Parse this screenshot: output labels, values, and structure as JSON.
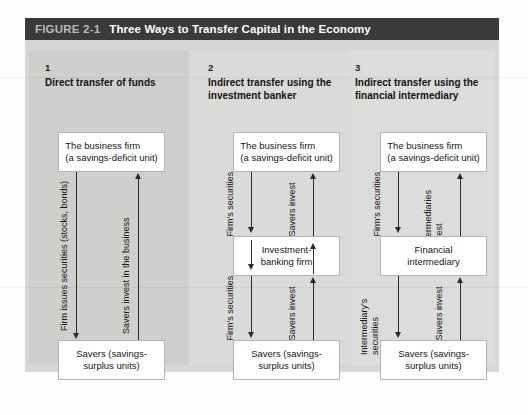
{
  "figure": {
    "label": "FIGURE 2-1",
    "title": "Three Ways to Transfer Capital in the Economy"
  },
  "columns": [
    {
      "number": "1",
      "heading": "Direct transfer of funds",
      "top_box": "The business firm\n(a savings-deficit unit)",
      "top_box_line1": "The business firm",
      "top_box_line2": "(a savings-deficit unit)",
      "middle_box": null,
      "bottom_box_line1": "Savers (savings-",
      "bottom_box_line2": "surplus units)",
      "down_label": "Firm issues securities (stocks, bonds)",
      "up_label": "Savers invest in the business"
    },
    {
      "number": "2",
      "heading": "Indirect transfer using the investment banker",
      "heading_line1": "Indirect transfer using the",
      "heading_line2": "investment banker",
      "top_box_line1": "The business firm",
      "top_box_line2": "(a savings-deficit unit)",
      "middle_box_line1": "Investment-",
      "middle_box_line2": "banking firm",
      "bottom_box_line1": "Savers (savings-",
      "bottom_box_line2": "surplus units)",
      "down_label_upper": "Firm's securities",
      "up_label_upper": "Savers invest",
      "down_label_lower": "Firm's securities",
      "up_label_lower": "Savers invest"
    },
    {
      "number": "3",
      "heading": "Indirect transfer using the financial intermediary",
      "heading_line1": "Indirect transfer using the",
      "heading_line2": "financial intermediary",
      "top_box_line1": "The business firm",
      "top_box_line2": "(a savings-deficit unit)",
      "middle_box_line1": "Financial",
      "middle_box_line2": "intermediary",
      "bottom_box_line1": "Savers (savings-",
      "bottom_box_line2": "surplus units)",
      "down_label_upper": "Firm's securities",
      "up_label_upper": "Intermediaries invest",
      "down_label_lower": "Intermediary's securities",
      "up_label_lower": "Savers invest"
    }
  ],
  "colors": {
    "title_bar": "#3a3a3a",
    "panel_bg": "#d6d6d4",
    "box_bg": "#ffffff",
    "arrow": "#2a2a2a"
  }
}
